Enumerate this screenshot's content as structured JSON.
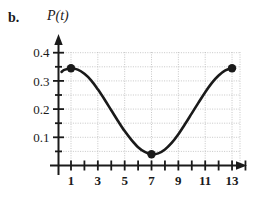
{
  "figure": {
    "part_label": "b.",
    "function_label": "P(t)"
  },
  "axes": {
    "y_tick_labels": [
      "0.4",
      "0.3",
      "0.2",
      "0.1"
    ],
    "x_tick_labels": [
      "1",
      "3",
      "5",
      "7",
      "9",
      "11",
      "13"
    ],
    "curve_color": "#1a1a1a",
    "grid_color": "#b9b9b9",
    "axis_color": "#1a1a1a"
  },
  "chart_data": {
    "type": "line",
    "title": "",
    "xlabel": "",
    "ylabel": "P(t)",
    "xlim": [
      0,
      14.2
    ],
    "ylim": [
      0,
      0.44
    ],
    "grid": true,
    "legend": "none",
    "x_ticks": [
      1,
      2,
      3,
      4,
      5,
      6,
      7,
      8,
      9,
      10,
      11,
      12,
      13,
      14
    ],
    "x_tick_labels_shown": [
      1,
      3,
      5,
      7,
      9,
      11,
      13
    ],
    "y_ticks": [
      0.05,
      0.1,
      0.15,
      0.2,
      0.25,
      0.3,
      0.35,
      0.4
    ],
    "y_tick_labels_shown": [
      0.1,
      0.2,
      0.3,
      0.4
    ],
    "series": [
      {
        "name": "P(t)",
        "x": [
          0.3,
          0.5,
          1.0,
          1.5,
          2.0,
          2.5,
          3.0,
          3.5,
          4.0,
          4.5,
          5.0,
          5.5,
          6.0,
          6.5,
          7.0,
          7.5,
          8.0,
          8.5,
          9.0,
          9.5,
          10.0,
          10.5,
          11.0,
          11.5,
          12.0,
          12.5,
          13.0
        ],
        "y": [
          0.332,
          0.339,
          0.345,
          0.34,
          0.325,
          0.302,
          0.27,
          0.234,
          0.196,
          0.158,
          0.122,
          0.091,
          0.065,
          0.048,
          0.04,
          0.043,
          0.057,
          0.08,
          0.111,
          0.147,
          0.185,
          0.223,
          0.26,
          0.293,
          0.319,
          0.337,
          0.345
        ]
      }
    ],
    "markers": [
      {
        "label": "start-point",
        "x": 1,
        "y": 0.345
      },
      {
        "label": "minimum-point",
        "x": 7,
        "y": 0.04
      },
      {
        "label": "end-point",
        "x": 13,
        "y": 0.345
      }
    ]
  }
}
